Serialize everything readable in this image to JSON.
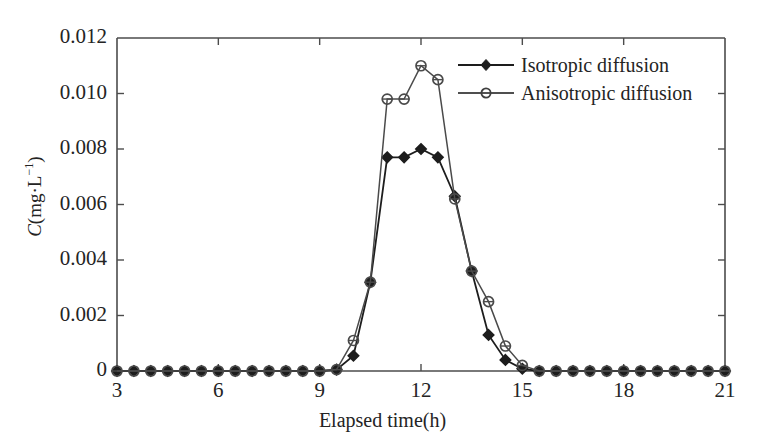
{
  "chart_data": {
    "type": "line",
    "title": "",
    "xlabel": "Elapsed time(h)",
    "ylabel": "C(mg·L⁻¹)",
    "xlim": [
      3,
      21
    ],
    "ylim": [
      0,
      0.012
    ],
    "xticks": [
      3,
      6,
      9,
      12,
      15,
      18,
      21
    ],
    "xtick_labels": [
      "3",
      "6",
      "9",
      "12",
      "15",
      "18",
      "21"
    ],
    "yticks": [
      0,
      0.002,
      0.004,
      0.006,
      0.008,
      0.01,
      0.012
    ],
    "ytick_labels": [
      "0",
      "0.002",
      "0.004",
      "0.006",
      "0.008",
      "0.010",
      "0.012"
    ],
    "grid": false,
    "legend_position": "upper right",
    "x": [
      3.0,
      3.5,
      4.0,
      4.5,
      5.0,
      5.5,
      6.0,
      6.5,
      7.0,
      7.5,
      8.0,
      8.5,
      9.0,
      9.5,
      10.0,
      10.5,
      11.0,
      11.5,
      12.0,
      12.5,
      13.0,
      13.5,
      14.0,
      14.5,
      15.0,
      15.5,
      16.0,
      16.5,
      17.0,
      17.5,
      18.0,
      18.5,
      19.0,
      19.5,
      20.0,
      20.5,
      21.0
    ],
    "series": [
      {
        "name": "Isotropic diffusion",
        "marker": "filled-diamond",
        "color": "#1d1d1d",
        "values": [
          0,
          0,
          0,
          0,
          0,
          0,
          0,
          0,
          0,
          0,
          0,
          0,
          0,
          5e-05,
          0.00055,
          0.0032,
          0.0077,
          0.0077,
          0.008,
          0.0077,
          0.0063,
          0.0036,
          0.0013,
          0.0004,
          8e-05,
          0,
          0,
          0,
          0,
          0,
          0,
          0,
          0,
          0,
          0,
          0,
          0
        ]
      },
      {
        "name": "Anisotropic diffusion",
        "marker": "open-circle",
        "color": "#4a4a4a",
        "values": [
          0,
          0,
          0,
          0,
          0,
          0,
          0,
          0,
          0,
          0,
          0,
          0,
          0,
          5e-05,
          0.0011,
          0.0032,
          0.0098,
          0.0098,
          0.011,
          0.0105,
          0.0062,
          0.0036,
          0.0025,
          0.0009,
          0.0002,
          0,
          0,
          0,
          0,
          0,
          0,
          0,
          0,
          0,
          0,
          0,
          0
        ]
      }
    ]
  },
  "legend": {
    "entries": [
      {
        "label": "Isotropic diffusion"
      },
      {
        "label": "Anisotropic diffusion"
      }
    ]
  }
}
